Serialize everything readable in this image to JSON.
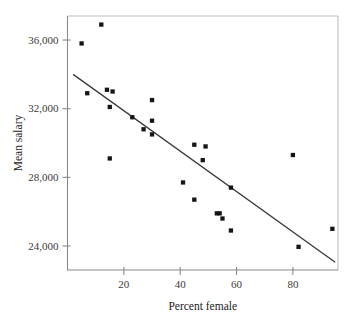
{
  "chart_data": {
    "type": "scatter",
    "title": "",
    "xlabel": "Percent female",
    "ylabel": "Mean salary",
    "xlim": [
      0,
      96
    ],
    "ylim": [
      22600,
      37400
    ],
    "grid": false,
    "legend": null,
    "xticks": [
      20,
      40,
      60,
      80
    ],
    "xtick_labels": [
      "20",
      "40",
      "60",
      "80"
    ],
    "yticks": [
      24000,
      28000,
      32000,
      36000
    ],
    "ytick_labels": [
      "24,000",
      "28,000",
      "36,000",
      "32,000"
    ],
    "ytick_labels_ordered": [
      "24,000",
      "28,000",
      "32,000",
      "36,000"
    ],
    "marker": "square",
    "marker_color": "#151515",
    "points": [
      {
        "x": 5,
        "y": 35800
      },
      {
        "x": 12,
        "y": 36900
      },
      {
        "x": 7,
        "y": 32900
      },
      {
        "x": 14,
        "y": 33100
      },
      {
        "x": 16,
        "y": 33000
      },
      {
        "x": 15,
        "y": 32100
      },
      {
        "x": 15,
        "y": 29100
      },
      {
        "x": 23,
        "y": 31500
      },
      {
        "x": 27,
        "y": 30800
      },
      {
        "x": 30,
        "y": 32500
      },
      {
        "x": 30,
        "y": 31300
      },
      {
        "x": 30,
        "y": 30500
      },
      {
        "x": 41,
        "y": 27700
      },
      {
        "x": 45,
        "y": 26700
      },
      {
        "x": 45,
        "y": 29900
      },
      {
        "x": 48,
        "y": 29000
      },
      {
        "x": 49,
        "y": 29800
      },
      {
        "x": 53,
        "y": 25900
      },
      {
        "x": 54,
        "y": 25900
      },
      {
        "x": 55,
        "y": 25600
      },
      {
        "x": 58,
        "y": 27400
      },
      {
        "x": 58,
        "y": 24900
      },
      {
        "x": 80,
        "y": 29300
      },
      {
        "x": 82,
        "y": 23950
      },
      {
        "x": 94,
        "y": 25000
      }
    ],
    "trend_line": {
      "type": "linear-fit",
      "x_start": 2,
      "y_start": 34000,
      "x_end": 95,
      "y_end": 23050
    }
  }
}
